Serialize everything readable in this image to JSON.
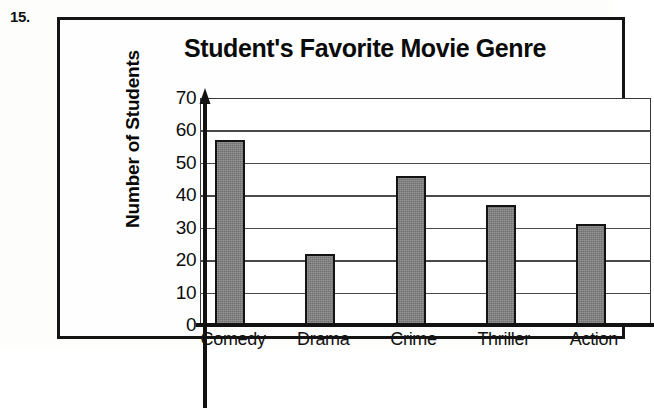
{
  "question_number": "15.",
  "chart_data": {
    "type": "bar",
    "title": "Student's Favorite Movie Genre",
    "xlabel": "",
    "ylabel": "Number of Students",
    "categories": [
      "Comedy",
      "Drama",
      "Crime",
      "Thriller",
      "Action"
    ],
    "values": [
      57,
      22,
      46,
      37,
      31
    ],
    "ylim": [
      0,
      70
    ],
    "ytick_values": [
      70,
      60,
      50,
      40,
      30,
      20,
      10,
      0
    ],
    "ytick_labels": [
      "70",
      "60",
      "50",
      "40",
      "30",
      "20",
      "10",
      "0"
    ],
    "grid": true,
    "legend": null,
    "bar_fill_color": "#7e7e7e",
    "bar_edge_color": "#131313",
    "axis_color": "#121212",
    "gridline_color": "#4a4a4a"
  }
}
